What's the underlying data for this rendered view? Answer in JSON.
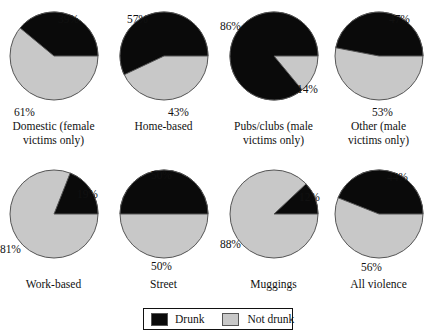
{
  "chart_data": {
    "type": "pie",
    "title": "",
    "legend": {
      "position": "bottom-center",
      "entries": [
        {
          "label": "Drunk",
          "color": "#0a0a0a",
          "key": "drunk"
        },
        {
          "label": "Not drunk",
          "color": "#c8c8c8",
          "key": "not_drunk"
        }
      ]
    },
    "series": [
      {
        "name": "Drunk",
        "color": "#0a0a0a",
        "values": [
          39,
          57,
          86,
          47,
          19,
          50,
          12,
          44
        ]
      },
      {
        "name": "Not drunk",
        "color": "#c8c8c8",
        "values": [
          61,
          43,
          14,
          53,
          81,
          50,
          88,
          56
        ]
      }
    ],
    "categories": [
      "Domestic (female victims only)",
      "Home-based",
      "Pubs/clubs (male victims only)",
      "Other (male victims only)",
      "Work-based",
      "Street",
      "Muggings",
      "All violence"
    ],
    "units": "percent",
    "start_angle_deg": 0,
    "direction": "counterclockwise",
    "panels": [
      {
        "caption": "Domestic (female\nvictims only)",
        "drunk_pct": 39,
        "not_drunk_pct": 12,
        "drunk_label": "39%",
        "not_drunk_label": "61%",
        "drunk_label_pos": {
          "left": 58,
          "top": 3
        },
        "not_drunk_label_pos": {
          "left": 14,
          "top": 96
        }
      },
      {
        "caption": "Home-based",
        "drunk_pct": 57,
        "not_drunk_pct": 43,
        "drunk_label": "57%",
        "not_drunk_label": "43%",
        "drunk_label_pos": {
          "left": 17,
          "top": 3
        },
        "not_drunk_label_pos": {
          "left": 58,
          "top": 96
        }
      },
      {
        "caption": "Pubs/clubs (male\nvictims only)",
        "drunk_pct": 86,
        "not_drunk_pct": 14,
        "drunk_label": "86%",
        "not_drunk_label": "14%",
        "drunk_label_pos": {
          "left": 0,
          "top": 10
        },
        "not_drunk_label_pos": {
          "left": 77,
          "top": 73
        }
      },
      {
        "caption": "Other (male\nvictims only)",
        "drunk_pct": 47,
        "not_drunk_pct": 53,
        "drunk_label": "47%",
        "not_drunk_label": "53%",
        "drunk_label_pos": {
          "left": 64,
          "top": 3
        },
        "not_drunk_label_pos": {
          "left": 47,
          "top": 96
        }
      },
      {
        "caption": "Work-based",
        "drunk_pct": 19,
        "not_drunk_pct": 81,
        "drunk_label": "19%",
        "not_drunk_label": "81%",
        "drunk_label_pos": {
          "left": 77,
          "top": 20
        },
        "not_drunk_label_pos": {
          "left": 0,
          "top": 75
        }
      },
      {
        "caption": "Street",
        "drunk_pct": 50,
        "not_drunk_pct": 50,
        "drunk_label": "50%",
        "not_drunk_label": "50%",
        "drunk_label_pos": {
          "left": 41,
          "top": 1
        },
        "not_drunk_label_pos": {
          "left": 41,
          "top": 92
        }
      },
      {
        "caption": "Muggings",
        "drunk_pct": 12,
        "not_drunk_pct": 88,
        "drunk_label": "12%",
        "not_drunk_label": "88%",
        "drunk_label_pos": {
          "left": 79,
          "top": 23
        },
        "not_drunk_label_pos": {
          "left": 0,
          "top": 70
        }
      },
      {
        "caption": "All violence",
        "drunk_pct": 44,
        "not_drunk_pct": 56,
        "drunk_label": "44%",
        "not_drunk_label": "56%",
        "drunk_label_pos": {
          "left": 62,
          "top": 3
        },
        "not_drunk_label_pos": {
          "left": 36,
          "top": 93
        }
      }
    ],
    "layout": {
      "columns": 4,
      "rows": 2,
      "col_x": [
        0,
        110,
        220,
        325
      ],
      "row_y": [
        10,
        168
      ],
      "pie_radius": 44,
      "caption_offset_y": 96
    }
  }
}
